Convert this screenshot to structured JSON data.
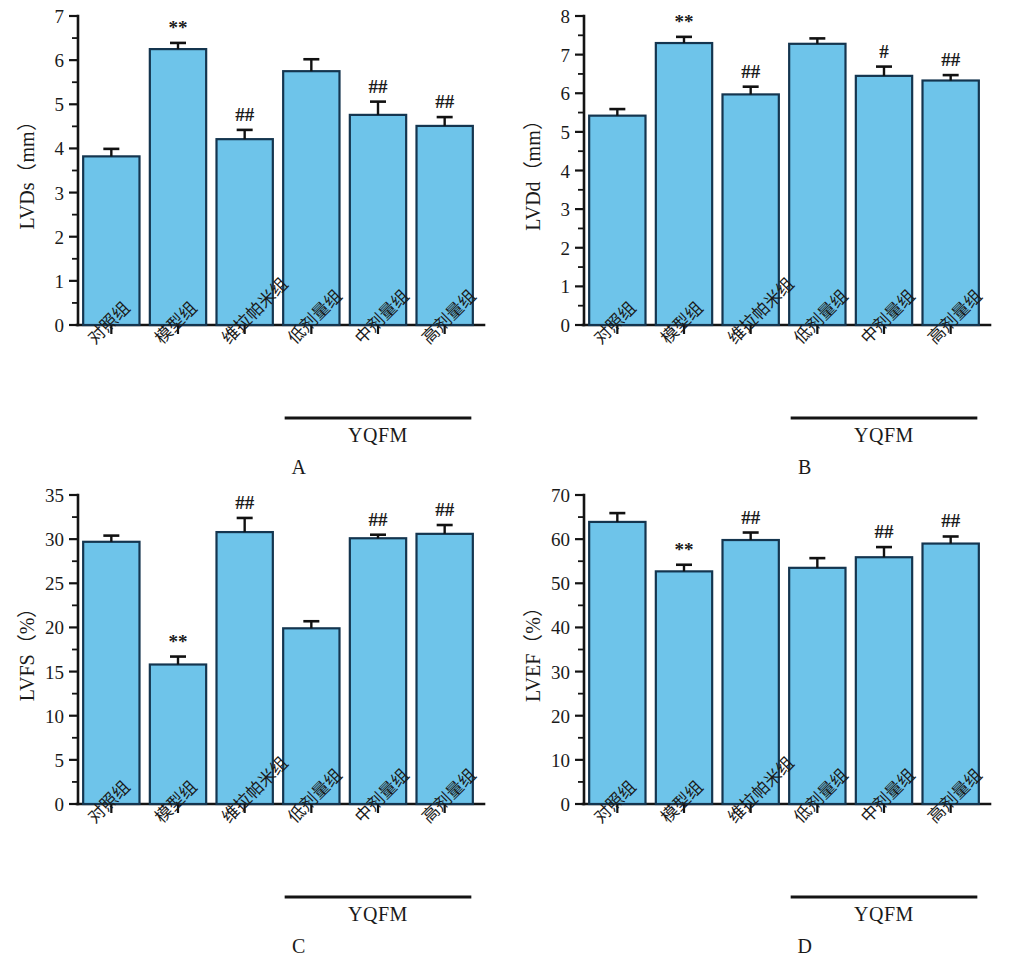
{
  "figure": {
    "background_color": "#ffffff",
    "bar_fill_color": "#6ec4ea",
    "bar_stroke_color": "#14354f",
    "axis_color": "#141414"
  },
  "categories": [
    "对照组",
    "模型组",
    "维拉帕米组",
    "低剂量组",
    "中剂量组",
    "高剂量组"
  ],
  "group_bracket_label": "YQFM",
  "panels": [
    {
      "letter": "A",
      "ylabel": "LVDs（mm）",
      "ticks": [
        "0",
        "1",
        "2",
        "3",
        "4",
        "5",
        "6",
        "7"
      ],
      "significance": [
        "",
        "**",
        "##",
        "",
        "##",
        "##"
      ]
    },
    {
      "letter": "B",
      "ylabel": "LVDd（mm）",
      "ticks": [
        "0",
        "1",
        "2",
        "3",
        "4",
        "5",
        "6",
        "7",
        "8"
      ],
      "significance": [
        "",
        "**",
        "##",
        "",
        "#",
        "##"
      ]
    },
    {
      "letter": "C",
      "ylabel": "LVFS（%）",
      "ticks": [
        "0",
        "5",
        "10",
        "15",
        "20",
        "25",
        "30",
        "35"
      ],
      "significance": [
        "",
        "**",
        "##",
        "",
        "##",
        "##"
      ]
    },
    {
      "letter": "D",
      "ylabel": "LVEF（%）",
      "ticks": [
        "0",
        "10",
        "20",
        "30",
        "40",
        "50",
        "60",
        "70"
      ],
      "significance": [
        "",
        "**",
        "##",
        "",
        "##",
        "##"
      ]
    }
  ],
  "chart_data": [
    {
      "type": "bar",
      "panel": "A",
      "title": "A",
      "xlabel": "",
      "ylabel": "LVDs（mm）",
      "categories": [
        "对照组",
        "模型组",
        "维拉帕米组",
        "低剂量组",
        "中剂量组",
        "高剂量组"
      ],
      "values": [
        3.82,
        6.25,
        4.21,
        5.75,
        4.76,
        4.51
      ],
      "errors": [
        0.17,
        0.14,
        0.21,
        0.27,
        0.3,
        0.2
      ],
      "annotations": [
        "",
        "**",
        "##",
        "",
        "##",
        "##"
      ],
      "ylim": [
        0,
        7
      ],
      "ytick_step": 1,
      "yminor_step": 0.5,
      "grid": false,
      "legend": "none",
      "group_bracket": {
        "label": "YQFM",
        "from_index": 3,
        "to_index": 5
      }
    },
    {
      "type": "bar",
      "panel": "B",
      "title": "B",
      "xlabel": "",
      "ylabel": "LVDd（mm）",
      "categories": [
        "对照组",
        "模型组",
        "维拉帕米组",
        "低剂量组",
        "中剂量组",
        "高剂量组"
      ],
      "values": [
        5.42,
        7.3,
        5.97,
        7.28,
        6.45,
        6.33
      ],
      "errors": [
        0.17,
        0.16,
        0.2,
        0.14,
        0.24,
        0.14
      ],
      "annotations": [
        "",
        "**",
        "##",
        "",
        "#",
        "##"
      ],
      "ylim": [
        0,
        8
      ],
      "ytick_step": 1,
      "yminor_step": 0.5,
      "grid": false,
      "legend": "none",
      "group_bracket": {
        "label": "YQFM",
        "from_index": 3,
        "to_index": 5
      }
    },
    {
      "type": "bar",
      "panel": "C",
      "title": "C",
      "xlabel": "",
      "ylabel": "LVFS（%）",
      "categories": [
        "对照组",
        "模型组",
        "维拉帕米组",
        "低剂量组",
        "中剂量组",
        "高剂量组"
      ],
      "values": [
        29.7,
        15.8,
        30.8,
        19.9,
        30.1,
        30.6
      ],
      "errors": [
        0.7,
        0.9,
        1.6,
        0.8,
        0.4,
        1.0
      ],
      "annotations": [
        "",
        "**",
        "##",
        "",
        "##",
        "##"
      ],
      "ylim": [
        0,
        35
      ],
      "ytick_step": 5,
      "yminor_step": 2.5,
      "grid": false,
      "legend": "none",
      "group_bracket": {
        "label": "YQFM",
        "from_index": 3,
        "to_index": 5
      }
    },
    {
      "type": "bar",
      "panel": "D",
      "title": "D",
      "xlabel": "",
      "ylabel": "LVEF（%）",
      "categories": [
        "对照组",
        "模型组",
        "维拉帕米组",
        "低剂量组",
        "中剂量组",
        "高剂量组"
      ],
      "values": [
        63.9,
        52.7,
        59.8,
        53.5,
        55.9,
        59.0
      ],
      "errors": [
        2.0,
        1.5,
        1.7,
        2.2,
        2.3,
        1.6
      ],
      "annotations": [
        "",
        "**",
        "##",
        "",
        "##",
        "##"
      ],
      "ylim": [
        0,
        70
      ],
      "ytick_step": 10,
      "yminor_step": 5,
      "grid": false,
      "legend": "none",
      "group_bracket": {
        "label": "YQFM",
        "from_index": 3,
        "to_index": 5
      }
    }
  ]
}
